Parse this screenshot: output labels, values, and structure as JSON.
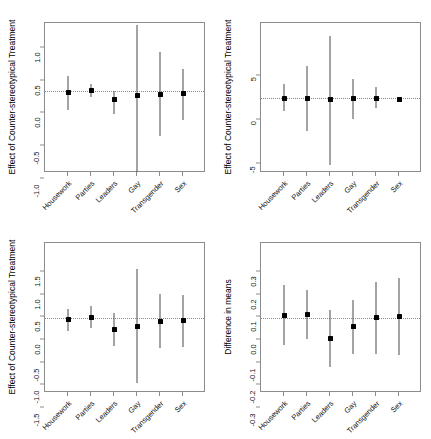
{
  "figure": {
    "layout": "2x2 grid of coefficient (forest) plots",
    "categories": [
      "Housework",
      "Parties",
      "Leaders",
      "Gay",
      "Transgender",
      "Sex"
    ]
  },
  "chart_data": [
    {
      "panel": "top-left",
      "type": "scatter",
      "title": "",
      "xlabel": "",
      "ylabel": "Effect of Counter-stereotypical Treatment",
      "ylim": [
        -1.25,
        1.05
      ],
      "yticks": [
        "1.0",
        "0.5",
        "0.0",
        "-0.5",
        "-1.0"
      ],
      "ytickvalues": [
        1.0,
        0.5,
        0.0,
        -0.5,
        -1.0
      ],
      "grid": false,
      "zero_reference_line": 0.0,
      "categories": [
        "Housework",
        "Parties",
        "Leaders",
        "Gay",
        "Transgender",
        "Sex"
      ],
      "values": [
        -0.01,
        0.01,
        -0.13,
        -0.06,
        -0.04,
        -0.03
      ],
      "ci_low": [
        -0.29,
        -0.08,
        -0.34,
        -1.23,
        -0.68,
        -0.43
      ],
      "ci_high": [
        0.24,
        0.12,
        0.01,
        1.02,
        0.6,
        0.35
      ]
    },
    {
      "panel": "top-right",
      "type": "scatter",
      "title": "",
      "xlabel": "",
      "ylabel": "Effect of Counter-stereotypical Treatment",
      "ylim": [
        -8.5,
        8.5
      ],
      "yticks": [
        "5",
        "0",
        "-5"
      ],
      "ytickvalues": [
        5,
        0,
        -5
      ],
      "grid": false,
      "zero_reference_line": 0,
      "categories": [
        "Housework",
        "Parties",
        "Leaders",
        "Gay",
        "Transgender",
        "Sex"
      ],
      "values": [
        -0.05,
        -0.05,
        -0.2,
        -0.05,
        -0.05,
        -0.15
      ],
      "ci_low": [
        -1.5,
        -3.7,
        -7.6,
        -2.4,
        -1.1,
        -0.3
      ],
      "ci_high": [
        1.6,
        3.6,
        7.0,
        2.2,
        1.3,
        0.0
      ]
    },
    {
      "panel": "bottom-left",
      "type": "scatter",
      "title": "",
      "xlabel": "",
      "ylabel": "Effect of Counter-stereotypical Treatment",
      "ylim": [
        -1.65,
        1.65
      ],
      "yticks": [
        "1.5",
        "1.0",
        "0.5",
        "0.0",
        "-0.5",
        "-1.0",
        "-1.5"
      ],
      "ytickvalues": [
        1.5,
        1.0,
        0.5,
        0.0,
        -0.5,
        -1.0,
        -1.5
      ],
      "grid": false,
      "zero_reference_line": 0.0,
      "categories": [
        "Housework",
        "Parties",
        "Leaders",
        "Gay",
        "Transgender",
        "Sex"
      ],
      "values": [
        -0.03,
        0.02,
        -0.25,
        -0.18,
        -0.07,
        -0.06
      ],
      "ci_low": [
        -0.29,
        -0.21,
        -0.61,
        -1.42,
        -0.66,
        -0.64
      ],
      "ci_high": [
        0.2,
        0.27,
        0.11,
        1.07,
        0.52,
        0.51
      ]
    },
    {
      "panel": "bottom-right",
      "type": "scatter",
      "title": "",
      "xlabel": "",
      "ylabel": "Difference in means",
      "ylim": [
        -0.33,
        0.33
      ],
      "yticks": [
        "0.3",
        "0.2",
        "0.1",
        "0.0",
        "-0.1",
        "-0.2",
        "-0.3"
      ],
      "ytickvalues": [
        0.3,
        0.2,
        0.1,
        0.0,
        -0.1,
        -0.2,
        -0.3
      ],
      "grid": false,
      "zero_reference_line": 0.0,
      "categories": [
        "Housework",
        "Parties",
        "Leaders",
        "Gay",
        "Transgender",
        "Sex"
      ],
      "values": [
        0.012,
        0.017,
        -0.089,
        -0.037,
        0.001,
        0.007
      ],
      "ci_low": [
        -0.119,
        -0.091,
        -0.214,
        -0.157,
        -0.158,
        -0.161
      ],
      "ci_high": [
        0.147,
        0.124,
        0.035,
        0.08,
        0.16,
        0.174
      ]
    }
  ]
}
